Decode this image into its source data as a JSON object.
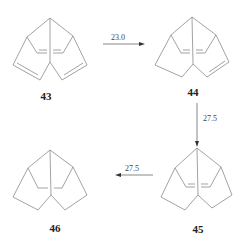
{
  "diagram": {
    "type": "reaction-scheme",
    "compounds": [
      {
        "id": "43",
        "label": "43",
        "double_bonds": [
          "left-ring",
          "center-bridge",
          "right-ring"
        ]
      },
      {
        "id": "44",
        "label": "44",
        "double_bonds": [
          "center-bridge",
          "right-ring"
        ]
      },
      {
        "id": "45",
        "label": "45",
        "double_bonds": [
          "center-bridge"
        ]
      },
      {
        "id": "46",
        "label": "46",
        "double_bonds": []
      }
    ],
    "arrows": [
      {
        "from": "43",
        "to": "44",
        "label": "23.0",
        "direction": "right"
      },
      {
        "from": "44",
        "to": "45",
        "label": "27.5",
        "direction": "down"
      },
      {
        "from": "45",
        "to": "46",
        "label": "27.5",
        "direction": "left"
      }
    ],
    "colors": {
      "bond": "#8a8a8a",
      "text": "#222222"
    }
  }
}
